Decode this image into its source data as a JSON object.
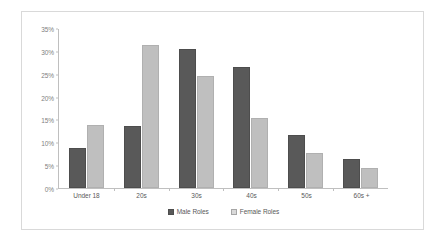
{
  "chart_data": {
    "type": "bar",
    "title": "",
    "xlabel": "",
    "ylabel": "",
    "categories": [
      "Under 18",
      "20s",
      "30s",
      "40s",
      "50s",
      "60s +"
    ],
    "series": [
      {
        "name": "Male Roles",
        "color": "#595959",
        "values": [
          8.7,
          13.7,
          30.5,
          26.7,
          11.6,
          6.3
        ]
      },
      {
        "name": "Female Roles",
        "color": "#bfbfbf",
        "values": [
          13.8,
          31.5,
          24.6,
          15.5,
          7.6,
          4.5
        ]
      }
    ],
    "ylim": [
      0,
      35
    ],
    "ytick_values": [
      0,
      5,
      10,
      15,
      20,
      25,
      30,
      35
    ],
    "ytick_labels": [
      "0%",
      "5%",
      "10%",
      "15%",
      "20%",
      "25%",
      "30%",
      "35%"
    ],
    "grid": false,
    "legend_position": "bottom",
    "axis_color": "#bfbfbf",
    "text_color": "#595959",
    "border_color": "#d9d9d9"
  }
}
